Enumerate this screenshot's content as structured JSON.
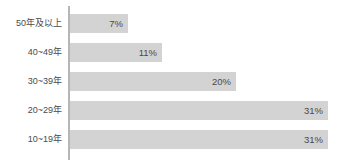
{
  "chart_data": {
    "type": "bar",
    "orientation": "horizontal",
    "title": "",
    "subtitle": "",
    "xlabel": "",
    "ylabel": "",
    "categories": [
      "50年及以上",
      "40~49年",
      "30~39年",
      "20~29年",
      "10~19年"
    ],
    "values": [
      7,
      11,
      20,
      31,
      31
    ],
    "value_labels": [
      "7%",
      "11%",
      "20%",
      "31%",
      "31%"
    ],
    "xlim": [
      0,
      31
    ],
    "grid": false,
    "legend": null,
    "legend_position": "none",
    "bar_color": "#d3d3d3",
    "axis_color": "#b6b6b6",
    "text_color": "#4a4a4a",
    "background_color": "#ffffff"
  }
}
